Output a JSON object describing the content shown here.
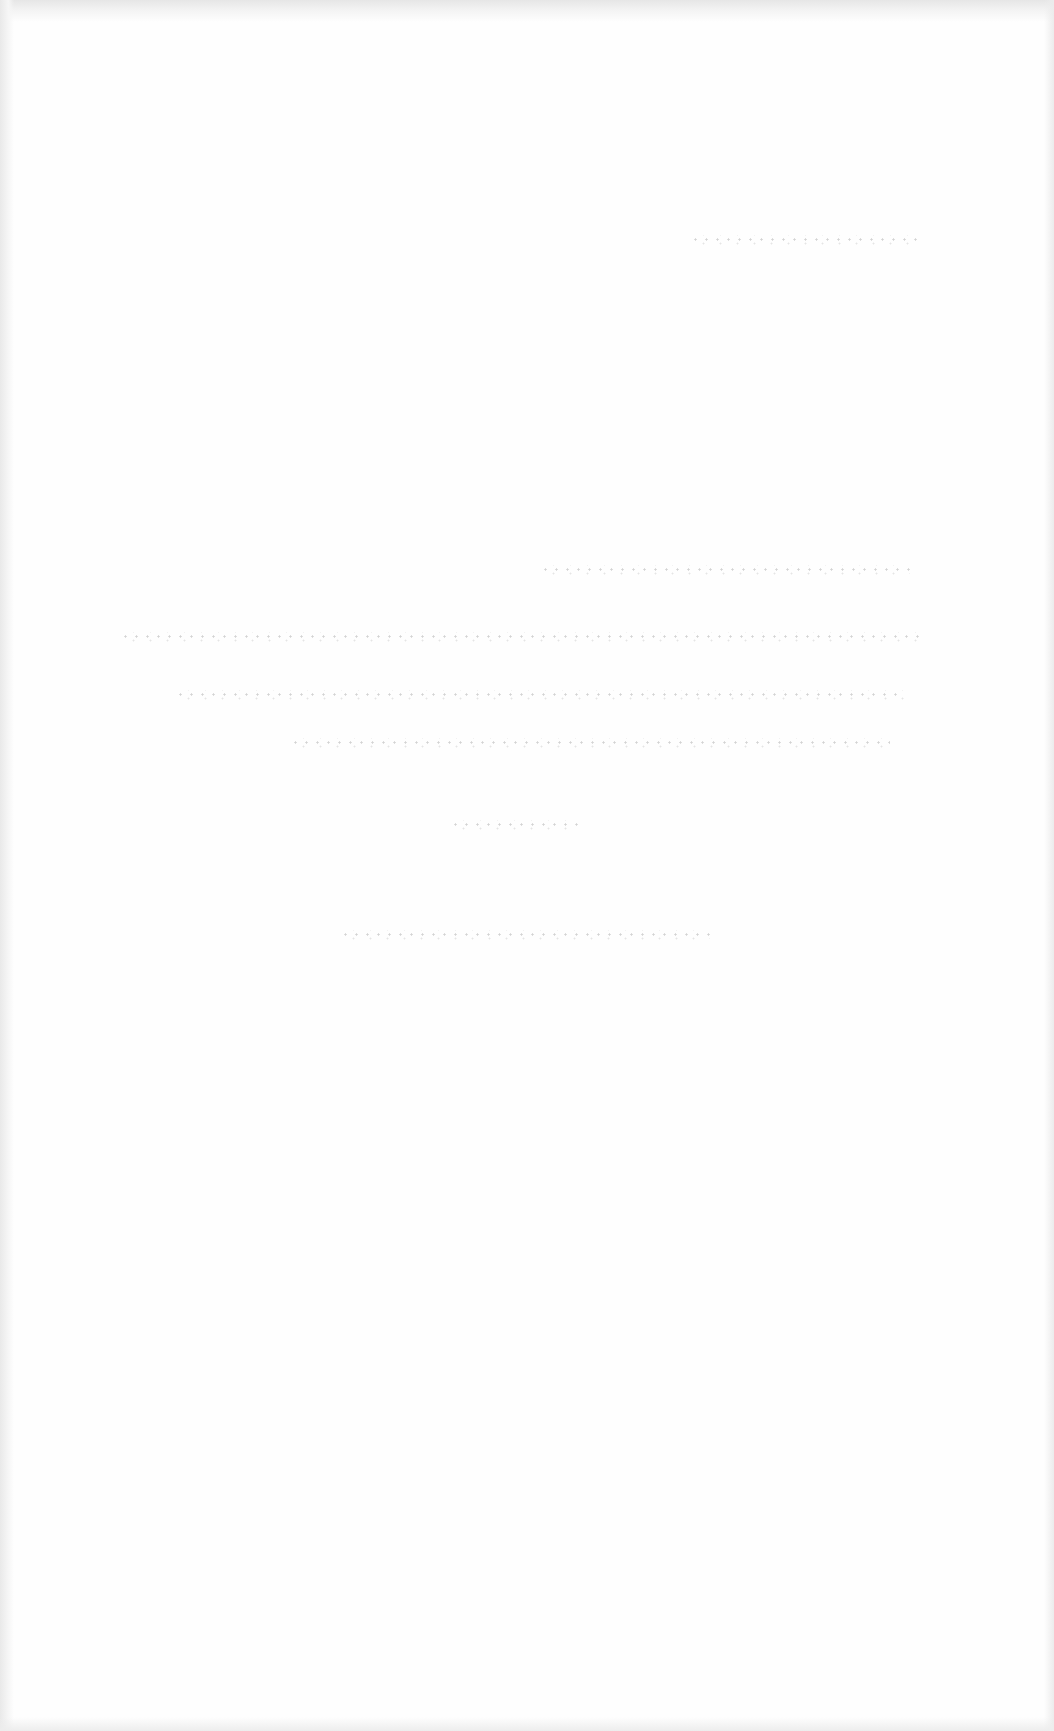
{
  "page": {
    "kind": "blank scanned page",
    "background_color": "#fefefe",
    "edge_shading_color": "#e6e6e6",
    "legible_text": []
  },
  "bleed_through_lines": [
    {
      "id": "line-1",
      "left": 690,
      "top": 235,
      "width": 230,
      "legible": false
    },
    {
      "id": "line-2",
      "left": 540,
      "top": 565,
      "width": 370,
      "legible": false
    },
    {
      "id": "line-3",
      "left": 120,
      "top": 632,
      "width": 800,
      "legible": false
    },
    {
      "id": "line-4",
      "left": 175,
      "top": 690,
      "width": 730,
      "legible": false
    },
    {
      "id": "line-5",
      "left": 290,
      "top": 738,
      "width": 600,
      "legible": false
    },
    {
      "id": "line-6",
      "left": 450,
      "top": 820,
      "width": 130,
      "legible": false
    },
    {
      "id": "line-7",
      "left": 340,
      "top": 930,
      "width": 370,
      "legible": false
    }
  ]
}
